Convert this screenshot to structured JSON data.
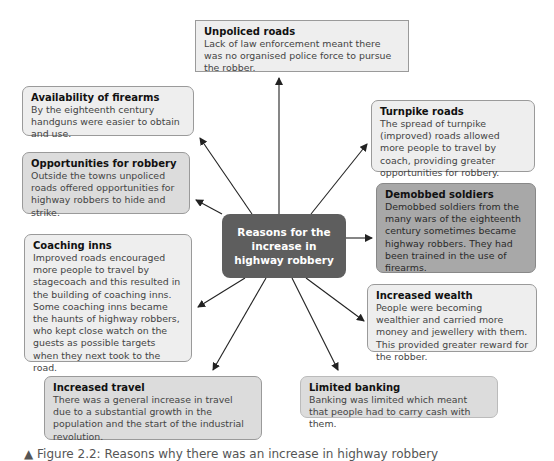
{
  "center": {
    "label": "Reasons for the increase in highway robbery"
  },
  "boxes": [
    {
      "id": "unpoliced-roads",
      "title": "Unpoliced roads",
      "body": "Lack of law enforcement meant there was no organised police force to pursue the robber."
    },
    {
      "id": "availability-of-firearms",
      "title": "Availability of firearms",
      "body": "By the eighteenth century handguns were easier to obtain and use."
    },
    {
      "id": "opportunities-for-robbery",
      "title": "Opportunities for robbery",
      "body": "Outside the towns unpoliced roads offered opportunities for highway robbers to hide and strike."
    },
    {
      "id": "coaching-inns",
      "title": "Coaching inns",
      "body": "Improved roads encouraged more people to travel by stagecoach and this resulted in the building of coaching inns. Some coaching inns became the haunts of highway robbers, who kept close watch on the guests as possible targets when they next took to the road."
    },
    {
      "id": "increased-travel",
      "title": "Increased travel",
      "body": "There was a general increase in travel due to a substantial growth in the population and the start of the industrial revolution."
    },
    {
      "id": "turnpike-roads",
      "title": "Turnpike roads",
      "body": "The spread of turnpike (improved) roads allowed more people to travel by coach, providing greater opportunities for robbery."
    },
    {
      "id": "demobbed-soldiers",
      "title": "Demobbed soldiers",
      "body": "Demobbed soldiers from the many wars of the eighteenth century sometimes became highway robbers. They had been trained in the use of firearms."
    },
    {
      "id": "increased-wealth",
      "title": "Increased wealth",
      "body": "People were becoming wealthier and carried more money and jewellery with them. This provided greater reward for the robber."
    },
    {
      "id": "limited-banking",
      "title": "Limited banking",
      "body": "Banking was limited which meant that people had to carry cash with them."
    }
  ],
  "caption": "▲ Figure 2.2: Reasons why there was an increase in highway robbery",
  "colors": {
    "center_fill": "#5e5e5e",
    "box_light": "#eeeeee",
    "box_mid": "#dcdcdc",
    "box_dark": "#a8a8a8",
    "border": "#9a9a9a",
    "arrow": "#222222"
  }
}
